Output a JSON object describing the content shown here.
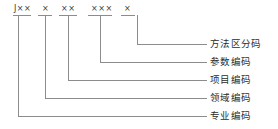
{
  "diagram": {
    "line_color": "#8c8c8c",
    "text_color": "#2b2b2b",
    "code_string": "J×× × ×× ××× ×",
    "segments": [
      {
        "id": "seg-1",
        "text": "J××",
        "x": 14,
        "tick_x1": 13,
        "tick_x2": 31,
        "stem_x": 18,
        "elbow_y": 116
      },
      {
        "id": "seg-2",
        "text": "×",
        "x": 42,
        "tick_x1": 38,
        "tick_x2": 52,
        "stem_x": 45,
        "elbow_y": 98
      },
      {
        "id": "seg-3",
        "text": "××",
        "x": 61,
        "tick_x1": 59,
        "tick_x2": 77,
        "stem_x": 68,
        "elbow_y": 80
      },
      {
        "id": "seg-4",
        "text": "×××",
        "x": 91,
        "tick_x1": 88,
        "tick_x2": 112,
        "stem_x": 100,
        "elbow_y": 62
      },
      {
        "id": "seg-5",
        "text": "×",
        "x": 124,
        "tick_x1": 121,
        "tick_x2": 135,
        "stem_x": 137,
        "elbow_y": 44
      }
    ],
    "tick_y": 15,
    "label_line_end_x": 207,
    "labels": [
      {
        "id": "label-1",
        "text": "方法区分码",
        "y": 44,
        "text_x": 210
      },
      {
        "id": "label-2",
        "text": "参数编码",
        "y": 62,
        "text_x": 210
      },
      {
        "id": "label-3",
        "text": "项目编码",
        "y": 80,
        "text_x": 210
      },
      {
        "id": "label-4",
        "text": "领域编码",
        "y": 98,
        "text_x": 210
      },
      {
        "id": "label-5",
        "text": "专业编码",
        "y": 116,
        "text_x": 210
      }
    ]
  }
}
